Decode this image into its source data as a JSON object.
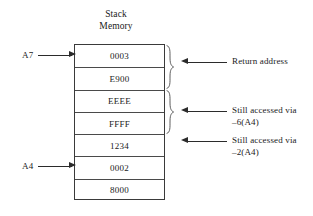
{
  "figure": {
    "title_lines": [
      "Stack",
      "Memory"
    ],
    "stack_cells": [
      {
        "value": "0003"
      },
      {
        "value": "E900"
      },
      {
        "value": "EEEE"
      },
      {
        "value": "FFFF"
      },
      {
        "value": "1234"
      },
      {
        "value": "0002"
      },
      {
        "value": "8000"
      }
    ],
    "registers": [
      {
        "name": "A7",
        "label": "A7",
        "points_to_cell": 0
      },
      {
        "name": "A4",
        "label": "A4",
        "points_to_cell": 5
      }
    ],
    "braces": [
      {
        "name": "brace-return-address",
        "spans_cells": [
          0,
          1
        ]
      },
      {
        "name": "brace-local-variable",
        "spans_cells": [
          2,
          3
        ]
      }
    ],
    "annotations": [
      {
        "name": "return-address",
        "lines": [
          "Return address"
        ],
        "points_to_cells": [
          0,
          1
        ]
      },
      {
        "name": "accessed-via-minus-6-a4",
        "lines": [
          "Still accessed via",
          "–6(A4)"
        ],
        "points_to_cells": [
          2,
          3
        ]
      },
      {
        "name": "accessed-via-minus-2-a4",
        "lines": [
          "Still accessed via",
          "–2(A4)"
        ],
        "points_to_cells": [
          4
        ]
      }
    ],
    "colors": {
      "background": "#ffffff",
      "box_border": "#3a3a3a",
      "cell_divider": "#4a4a4a",
      "arrow": "#2b2b2b",
      "text": "#1a1a1a",
      "brace": "#555555"
    }
  }
}
